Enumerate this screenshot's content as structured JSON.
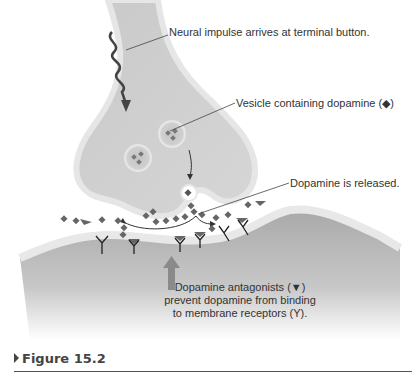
{
  "figure": {
    "labels": {
      "impulse": "Neural impulse arrives at terminal button.",
      "vesicle": "Vesicle containing dopamine (◆)",
      "released": "Dopamine is released.",
      "antagonist_line1": "Dopamine antagonists (▼)",
      "antagonist_line2": "prevent dopamine from binding",
      "antagonist_line3": "to membrane receptors (Υ)."
    },
    "caption": "Figure 15.2",
    "colors": {
      "neuron_fill": "#cfcfcf",
      "neuron_edge": "#e6e6e6",
      "postsynaptic": "#b5b5b5",
      "arrow": "#8a8a8a",
      "dopamine": "#555555",
      "text": "#333333"
    }
  }
}
